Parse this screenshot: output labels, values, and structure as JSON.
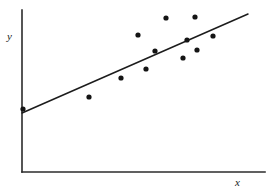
{
  "figure": {
    "title": "",
    "background_color": "#ffffff",
    "width": 273,
    "height": 191
  },
  "axes": {
    "x_label": "x",
    "y_label": "y",
    "axis_color": "#2b2b2b",
    "x_axis": {
      "x_start": 22,
      "x_end": 265,
      "y": 172
    },
    "y_axis": {
      "x": 22,
      "y_start": 10,
      "y_end": 172
    },
    "ticks_shown": false,
    "tick_labels_x": [],
    "tick_labels_y": [],
    "grid": false
  },
  "trend_line": {
    "label": "regression-line",
    "color": "#1c1c1c",
    "x1": 22,
    "y1": 113,
    "x2": 248,
    "y2": 14
  },
  "points_style": {
    "color": "#141414",
    "radius": 2.6,
    "marker": "filled-circle"
  },
  "chart_data": {
    "type": "scatter",
    "title": "",
    "xlabel": "x",
    "ylabel": "y",
    "grid": false,
    "legend": null,
    "xlim": [
      0,
      1
    ],
    "ylim": [
      0,
      1
    ],
    "series": [
      {
        "name": "observations",
        "marker": "filled-circle",
        "color": "#141414",
        "points_pixel": [
          [
            23,
            109
          ],
          [
            89,
            97
          ],
          [
            121,
            78
          ],
          [
            138,
            35
          ],
          [
            146,
            69
          ],
          [
            155,
            51
          ],
          [
            166,
            18
          ],
          [
            183,
            58
          ],
          [
            187,
            40
          ],
          [
            195,
            17
          ],
          [
            197,
            50
          ],
          [
            213,
            36
          ]
        ],
        "x": [
          0.004,
          0.276,
          0.408,
          0.478,
          0.511,
          0.547,
          0.593,
          0.663,
          0.679,
          0.712,
          0.72,
          0.786
        ],
        "y": [
          0.389,
          0.463,
          0.58,
          0.846,
          0.636,
          0.747,
          0.951,
          0.704,
          0.815,
          0.963,
          0.753,
          0.84
        ]
      },
      {
        "name": "fitted-line",
        "marker": "line",
        "color": "#1c1c1c",
        "endpoints_pixel": [
          [
            22,
            113
          ],
          [
            248,
            14
          ]
        ],
        "x": [
          0.0,
          0.93
        ],
        "y": [
          0.364,
          0.975
        ]
      }
    ]
  }
}
